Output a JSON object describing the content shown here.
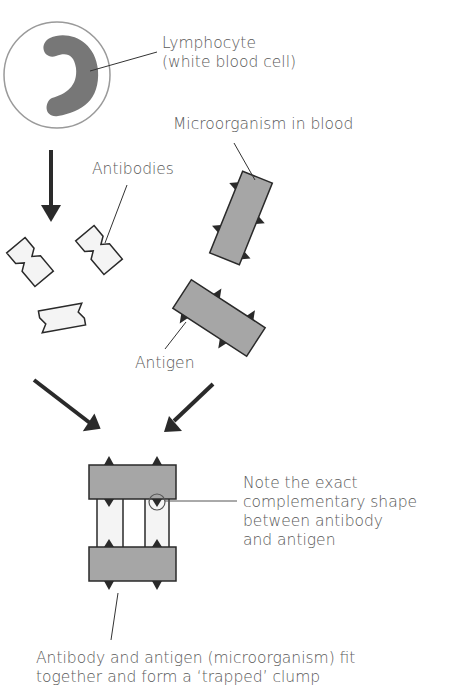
{
  "diagram": {
    "title_cutoff": "g y",
    "labels": {
      "lymphocyte_line1": "Lymphocyte",
      "lymphocyte_line2": "(white blood cell)",
      "microorganism": "Microorganism in blood",
      "antibodies": "Antibodies",
      "antigen": "Antigen",
      "note_line1": "Note the exact",
      "note_line2": "complementary shape",
      "note_line3": "between antibody",
      "note_line4": "and antigen",
      "caption_line1": "Antibody and antigen (microorganism) fit",
      "caption_line2": "together and form a ‘trapped’ clump"
    },
    "colors": {
      "microorganism_fill": "#a6a6a6",
      "nucleus_fill": "#777777",
      "antibody_fill": "#f4f4f4",
      "outline": "#2a2a2a",
      "arrow": "#2a2a2a",
      "cell_outline": "#9a9a9a",
      "text": "#5a5a5a"
    }
  }
}
